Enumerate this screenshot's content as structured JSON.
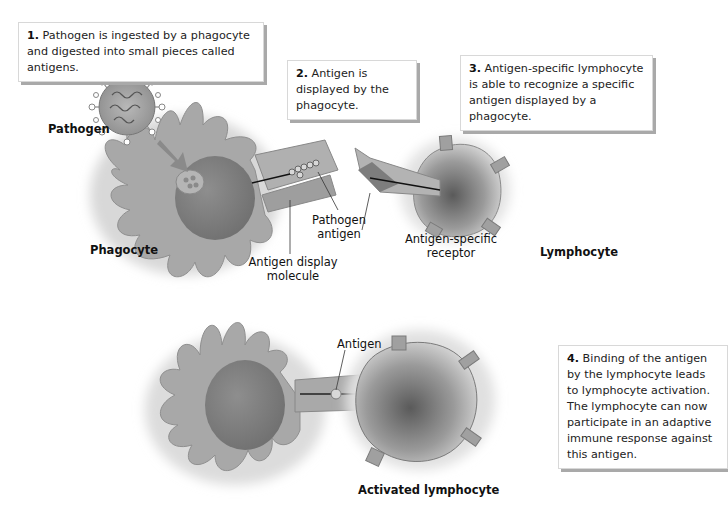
{
  "diagram": {
    "steps": [
      {
        "number": "1.",
        "text": "Pathogen is ingested by a phagocyte and digested into small pieces called antigens."
      },
      {
        "number": "2.",
        "text": "Antigen is displayed by the phagocyte."
      },
      {
        "number": "3.",
        "text": "Antigen-specific lymphocyte is able to recognize a specific antigen displayed by a phagocyte."
      },
      {
        "number": "4.",
        "text": "Binding of the antigen by the lymphocyte leads to lymphocyte activation. The lymphocyte can now participate in an adaptive immune response against this antigen."
      }
    ],
    "labels": {
      "pathogen": "Pathogen",
      "phagocyte": "Phagocyte",
      "pathogen_antigen": "Pathogen antigen",
      "antigen_display_molecule": "Antigen display molecule",
      "antigen_specific_receptor": "Antigen-specific receptor",
      "lymphocyte": "Lymphocyte",
      "antigen": "Antigen",
      "activated_lymphocyte": "Activated lymphocyte"
    },
    "colors": {
      "cell_fill": "#a9a9a9",
      "nucleus": "#7d7d7d",
      "callout_shadow": "#a9a9a9"
    }
  }
}
